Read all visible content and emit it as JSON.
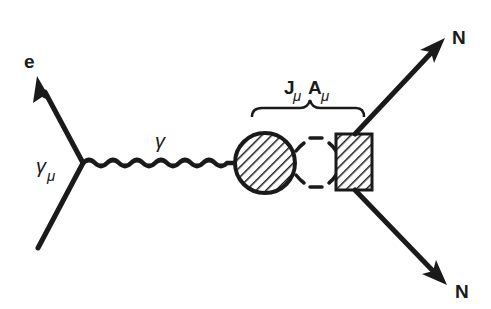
{
  "diagram": {
    "type": "feynman-diagram",
    "colors": {
      "ink": "#1a1a1a",
      "background": "#ffffff"
    },
    "labels": {
      "electron": "e",
      "vertex_coupling": "γ",
      "vertex_coupling_sub": "μ",
      "photon": "γ",
      "interaction_J": "J",
      "interaction_J_sub": "μ",
      "interaction_A": "A",
      "interaction_A_sub": "μ",
      "nucleon_out_upper": "N",
      "nucleon_out_lower": "N"
    },
    "elements": [
      {
        "name": "incoming-electron-line",
        "from": [
          38,
          248
        ],
        "to": [
          83,
          163
        ]
      },
      {
        "name": "outgoing-electron-arrow",
        "from": [
          83,
          163
        ],
        "to": [
          37,
          76
        ]
      },
      {
        "name": "virtual-photon-wavy-line",
        "from": [
          83,
          163
        ],
        "to": [
          234,
          163
        ]
      },
      {
        "name": "hadronic-blob-circle",
        "center": [
          265,
          163
        ],
        "radius": 31,
        "fill": "hatched"
      },
      {
        "name": "meson-loop-dashed",
        "between": [
          "circle",
          "box"
        ]
      },
      {
        "name": "nucleus-box",
        "x": 336,
        "y": 134,
        "w": 36,
        "h": 56,
        "fill": "hatched"
      },
      {
        "name": "brace-over-interaction",
        "label": "JμAμ"
      },
      {
        "name": "outgoing-nucleon-upper",
        "from": [
          355,
          134
        ],
        "to": [
          445,
          38
        ]
      },
      {
        "name": "outgoing-nucleon-lower",
        "from": [
          355,
          190
        ],
        "to": [
          447,
          285
        ]
      }
    ]
  }
}
